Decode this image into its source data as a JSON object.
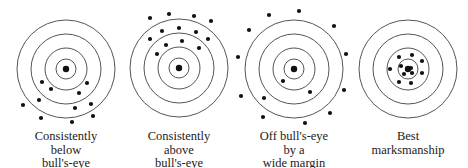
{
  "figure": {
    "targets": [
      {
        "caption_lines": [
          "Consistently",
          "below",
          "bull's-eye"
        ],
        "center": [
          66,
          69
        ],
        "ring_radii": [
          49,
          35,
          21,
          10
        ],
        "shots": [
          [
            42,
            82
          ],
          [
            87,
            83
          ],
          [
            51,
            89
          ],
          [
            79,
            93
          ],
          [
            39,
            100
          ],
          [
            23,
            105
          ],
          [
            75,
            108
          ],
          [
            91,
            104
          ],
          [
            41,
            118
          ],
          [
            93,
            116
          ],
          [
            72,
            122
          ]
        ]
      },
      {
        "caption_lines": [
          "Consistently",
          "above",
          "bull's-eye"
        ],
        "center": [
          179,
          68
        ],
        "ring_radii": [
          49,
          35,
          21,
          10
        ],
        "shots": [
          [
            150,
            18
          ],
          [
            169,
            14
          ],
          [
            194,
            16
          ],
          [
            211,
            21
          ],
          [
            162,
            31
          ],
          [
            179,
            28
          ],
          [
            196,
            32
          ],
          [
            150,
            39
          ],
          [
            208,
            39
          ],
          [
            166,
            45
          ],
          [
            182,
            41
          ],
          [
            199,
            48
          ],
          [
            157,
            54
          ]
        ]
      },
      {
        "caption_lines": [
          "Off bull's-eye",
          "by a",
          "wide margin"
        ],
        "center": [
          294,
          69
        ],
        "ring_radii": [
          49,
          35,
          21,
          10
        ],
        "shots": [
          [
            269,
            15
          ],
          [
            299,
            11
          ],
          [
            334,
            26
          ],
          [
            249,
            30
          ],
          [
            346,
            54
          ],
          [
            238,
            57
          ],
          [
            283,
            81
          ],
          [
            344,
            90
          ],
          [
            310,
            92
          ],
          [
            241,
            96
          ],
          [
            264,
            98
          ],
          [
            330,
            113
          ],
          [
            263,
            117
          ],
          [
            305,
            123
          ]
        ]
      },
      {
        "caption_lines": [
          "Best",
          "marksmanship"
        ],
        "center": [
          408,
          69
        ],
        "ring_radii": [
          49,
          35,
          21,
          10
        ],
        "shots": [
          [
            399,
            57
          ],
          [
            412,
            55
          ],
          [
            422,
            61
          ],
          [
            401,
            66
          ],
          [
            390,
            69
          ],
          [
            411,
            68
          ],
          [
            404,
            74
          ],
          [
            412,
            73
          ],
          [
            422,
            73
          ],
          [
            399,
            82
          ],
          [
            411,
            83
          ]
        ]
      }
    ],
    "colors": {
      "ring": "#555555",
      "dot": "#111111"
    }
  }
}
